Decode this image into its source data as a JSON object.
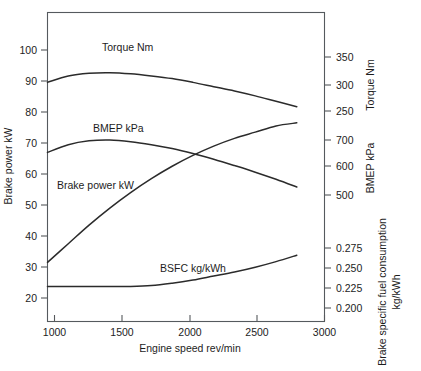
{
  "chart_data": {
    "type": "line",
    "title": "",
    "xlabel": "Engine speed rev/min",
    "xlim": [
      1000,
      3000
    ],
    "xticks": [
      1000,
      1500,
      2000,
      2500,
      3000
    ],
    "xticklabels": [
      "1000",
      "1500",
      "2000",
      "2500",
      "3000"
    ],
    "grid": false,
    "legend_position": "inline-annotations",
    "axes": [
      {
        "id": "brake-power",
        "side": "left",
        "label": "Brake power kW",
        "ticks": [
          20,
          30,
          40,
          50,
          60,
          70,
          80,
          90,
          100
        ],
        "ticklabels": [
          "20",
          "30",
          "40",
          "50",
          "60",
          "70",
          "80",
          "90",
          "100"
        ],
        "lim": [
          15,
          105
        ]
      },
      {
        "id": "torque",
        "side": "right",
        "label": "Torque Nm",
        "ticks": [
          250,
          300,
          350
        ],
        "ticklabels": [
          "250",
          "300",
          "350"
        ],
        "lim": [
          200,
          400
        ]
      },
      {
        "id": "bmep",
        "side": "right",
        "label": "BMEP kPa",
        "ticks": [
          500,
          600,
          700
        ],
        "ticklabels": [
          "500",
          "600",
          "700"
        ],
        "lim": [
          400,
          800
        ]
      },
      {
        "id": "bsfc",
        "side": "right",
        "label": "Brake specific fuel consumption kg/kWh",
        "ticks": [
          0.2,
          0.225,
          0.25,
          0.275
        ],
        "ticklabels": [
          "0.200",
          "0.225",
          "0.250",
          "0.275"
        ],
        "lim": [
          0.175,
          0.3
        ]
      }
    ],
    "series": [
      {
        "name": "Torque Nm",
        "axis": "torque",
        "annotation": "Torque Nm",
        "x": [
          1000,
          1150,
          1300,
          1450,
          1600,
          1750,
          1900,
          2050,
          2200,
          2350,
          2500,
          2650,
          2800
        ],
        "values": [
          303,
          315,
          320,
          321,
          319,
          315,
          310,
          303,
          295,
          287,
          278,
          268,
          258
        ]
      },
      {
        "name": "BMEP kPa",
        "axis": "bmep",
        "annotation": "BMEP kPa",
        "x": [
          1000,
          1150,
          1300,
          1450,
          1600,
          1750,
          1900,
          2050,
          2200,
          2350,
          2500,
          2650,
          2800
        ],
        "values": [
          655,
          683,
          697,
          700,
          694,
          683,
          669,
          651,
          630,
          607,
          583,
          557,
          529
        ]
      },
      {
        "name": "Brake power kW",
        "axis": "brake-power",
        "annotation": "Brake power kW",
        "x": [
          1000,
          1150,
          1300,
          1450,
          1600,
          1750,
          1900,
          2050,
          2200,
          2350,
          2500,
          2650,
          2800
        ],
        "values": [
          31.5,
          37.5,
          43.5,
          49.0,
          54.0,
          58.5,
          62.5,
          66.0,
          69.0,
          71.5,
          73.5,
          75.5,
          76.5
        ]
      },
      {
        "name": "BSFC kg/kWh",
        "axis": "bsfc",
        "annotation": "BSFC kg/kWh",
        "x": [
          1000,
          1150,
          1300,
          1450,
          1600,
          1750,
          1900,
          2050,
          2200,
          2350,
          2500,
          2650,
          2800
        ],
        "values": [
          0.227,
          0.227,
          0.227,
          0.227,
          0.227,
          0.228,
          0.231,
          0.235,
          0.24,
          0.245,
          0.251,
          0.258,
          0.266
        ]
      }
    ],
    "colors": {
      "curve": "#2b2b2b",
      "axis": "#55585c",
      "background": "#ffffff"
    }
  }
}
